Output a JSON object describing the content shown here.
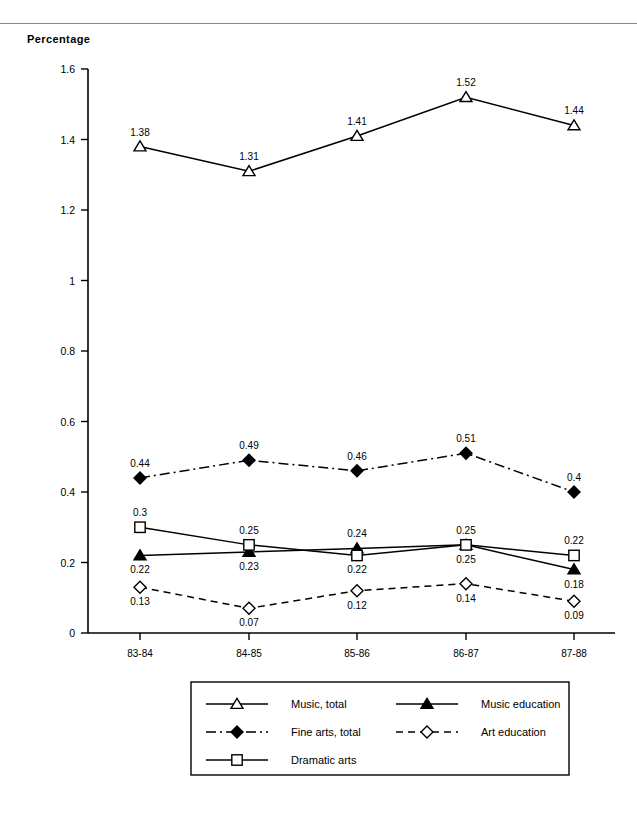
{
  "page": {
    "axis_title": "Percentage",
    "header_fragment": ""
  },
  "chart_data": {
    "type": "line",
    "title": "",
    "xlabel": "",
    "ylabel": "Percentage",
    "categories": [
      "83-84",
      "84-85",
      "85-86",
      "86-87",
      "87-88"
    ],
    "ylim": [
      0,
      1.6
    ],
    "yticks": [
      "0",
      "0.2",
      "0.4",
      "0.6",
      "0.8",
      "1",
      "1.2",
      "1.4",
      "1.6"
    ],
    "ytick_values": [
      0,
      0.2,
      0.4,
      0.6,
      0.8,
      1,
      1.2,
      1.4,
      1.6
    ],
    "grid": false,
    "legend_position": "bottom",
    "series": [
      {
        "name": "Music, total",
        "marker": "triangle-open",
        "linestyle": "solid",
        "values": [
          1.38,
          1.31,
          1.41,
          1.52,
          1.44
        ],
        "labels": [
          "1.38",
          "1.31",
          "1.41",
          "1.52",
          "1.44"
        ],
        "label_pos": [
          "above",
          "above",
          "above",
          "above",
          "above"
        ]
      },
      {
        "name": "Music education",
        "marker": "triangle-filled",
        "linestyle": "solid",
        "values": [
          0.22,
          0.23,
          0.24,
          0.25,
          0.18
        ],
        "labels": [
          "0.22",
          "0.23",
          "0.24",
          "0.25",
          "0.18"
        ],
        "label_pos": [
          "below",
          "below",
          "above",
          "below",
          "below"
        ]
      },
      {
        "name": "Fine arts, total",
        "marker": "diamond-filled",
        "linestyle": "dash-dot",
        "values": [
          0.44,
          0.49,
          0.46,
          0.51,
          0.4
        ],
        "labels": [
          "0.44",
          "0.49",
          "0.46",
          "0.51",
          "0.4"
        ],
        "label_pos": [
          "above",
          "above",
          "above",
          "above",
          "above"
        ]
      },
      {
        "name": "Art education",
        "marker": "diamond-open",
        "linestyle": "dashed",
        "values": [
          0.13,
          0.07,
          0.12,
          0.14,
          0.09
        ],
        "labels": [
          "0.13",
          "0.07",
          "0.12",
          "0.14",
          "0.09"
        ],
        "label_pos": [
          "below",
          "below",
          "below",
          "below",
          "below"
        ]
      },
      {
        "name": "Dramatic arts",
        "marker": "square-open",
        "linestyle": "solid",
        "values": [
          0.3,
          0.25,
          0.22,
          0.25,
          0.22
        ],
        "labels": [
          "0.3",
          "0.25",
          "0.22",
          "0.25",
          "0.22"
        ],
        "label_pos": [
          "above",
          "above",
          "below",
          "above",
          "above"
        ]
      }
    ]
  },
  "legend": {
    "entries": [
      {
        "label": "Music, total"
      },
      {
        "label": "Music education"
      },
      {
        "label": "Fine arts, total"
      },
      {
        "label": "Art education"
      },
      {
        "label": "Dramatic arts"
      }
    ]
  },
  "colors": {
    "ink": "#000000",
    "rule": "#8a8a8a",
    "background": "#ffffff"
  }
}
